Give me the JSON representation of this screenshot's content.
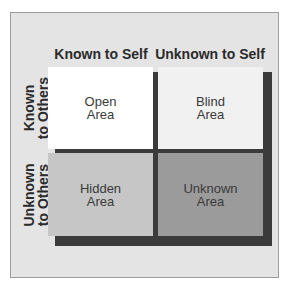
{
  "columns": [
    "Known to Self",
    "Unknown to Self"
  ],
  "rows": [
    {
      "line1": "Known",
      "line2": "to Others"
    },
    {
      "line1": "Unknown",
      "line2": "to Others"
    }
  ],
  "quadrants": [
    {
      "id": "open",
      "line1": "Open",
      "line2": "Area",
      "color": "#ffffff"
    },
    {
      "id": "blind",
      "line1": "Blind",
      "line2": "Area",
      "color": "#f1f1f1"
    },
    {
      "id": "hidden",
      "line1": "Hidden",
      "line2": "Area",
      "color": "#c6c6c6"
    },
    {
      "id": "unknown",
      "line1": "Unknown",
      "line2": "Area",
      "color": "#9b9b9b"
    }
  ],
  "colors": {
    "panel": "#e4e4e4",
    "shadow": "#3b3b3b",
    "text": "#2b2b2b"
  }
}
